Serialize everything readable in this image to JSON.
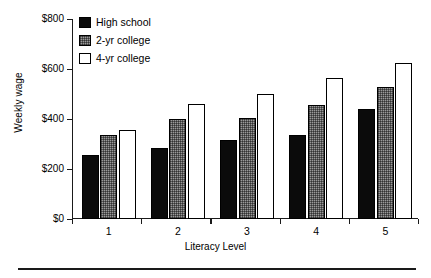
{
  "chart_data": {
    "type": "bar",
    "title": "",
    "xlabel": "Literacy Level",
    "ylabel": "Weekly wage",
    "categories": [
      "1",
      "2",
      "3",
      "4",
      "5"
    ],
    "series": [
      {
        "name": "High school",
        "color": "#0b0b0b",
        "values": [
          255,
          283,
          315,
          335,
          440
        ]
      },
      {
        "name": "2-yr college",
        "color": "#9a9a9a",
        "values": [
          335,
          400,
          403,
          455,
          530
        ]
      },
      {
        "name": "4-yr college",
        "color": "#ffffff",
        "values": [
          358,
          460,
          500,
          565,
          625
        ]
      }
    ],
    "ylim": [
      0,
      800
    ],
    "yticks": [
      0,
      200,
      400,
      600,
      800
    ],
    "ytick_labels": [
      "$0",
      "$200",
      "$400",
      "$600",
      "$800"
    ],
    "grid": false,
    "legend_position": "top-left"
  },
  "axis": {
    "y_title": "Weekly wage",
    "x_title": "Literacy Level"
  },
  "legend": {
    "items": [
      {
        "label": "High school"
      },
      {
        "label": "2-yr college"
      },
      {
        "label": "4-yr college"
      }
    ]
  }
}
